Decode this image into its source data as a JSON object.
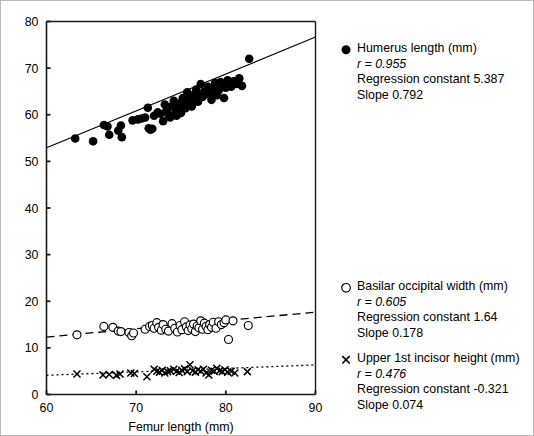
{
  "chart_data": {
    "type": "scatter",
    "title": "",
    "xlabel": "Femur length (mm)",
    "ylabel": "",
    "xlim": [
      60,
      90
    ],
    "ylim": [
      0,
      80
    ],
    "xticks": [
      60,
      70,
      80,
      90
    ],
    "yticks": [
      0,
      10,
      20,
      30,
      40,
      50,
      60,
      70,
      80
    ],
    "grid": false,
    "legend_position": "right",
    "series": [
      {
        "name": "Humerus length (mm)",
        "marker": "filled-circle",
        "line_style": "solid",
        "r": 0.955,
        "r_label": "r = 0.955",
        "regression_constant": 5.387,
        "regression_constant_label": "Regression constant 5.387",
        "slope": 0.792,
        "slope_label": "Slope 0.792",
        "points": [
          [
            63.2,
            54.9
          ],
          [
            65.2,
            54.3
          ],
          [
            66.4,
            57.8
          ],
          [
            66.8,
            57.5
          ],
          [
            67.0,
            55.7
          ],
          [
            68.0,
            56.6
          ],
          [
            68.3,
            57.7
          ],
          [
            68.4,
            55.2
          ],
          [
            69.6,
            58.8
          ],
          [
            70.2,
            59.0
          ],
          [
            70.6,
            59.2
          ],
          [
            71.0,
            59.4
          ],
          [
            71.3,
            61.5
          ],
          [
            71.4,
            57.1
          ],
          [
            71.6,
            56.8
          ],
          [
            71.8,
            57.0
          ],
          [
            72.0,
            59.8
          ],
          [
            72.4,
            60.5
          ],
          [
            72.7,
            60.2
          ],
          [
            73.0,
            58.6
          ],
          [
            73.2,
            62.2
          ],
          [
            73.4,
            61.0
          ],
          [
            73.6,
            60.0
          ],
          [
            73.8,
            59.4
          ],
          [
            74.0,
            61.8
          ],
          [
            74.2,
            63.0
          ],
          [
            74.4,
            60.6
          ],
          [
            74.5,
            59.8
          ],
          [
            74.7,
            62.4
          ],
          [
            74.9,
            61.2
          ],
          [
            75.0,
            60.4
          ],
          [
            75.2,
            63.6
          ],
          [
            75.3,
            62.0
          ],
          [
            75.5,
            61.4
          ],
          [
            75.7,
            64.8
          ],
          [
            75.9,
            63.2
          ],
          [
            76.0,
            62.6
          ],
          [
            76.2,
            61.8
          ],
          [
            76.4,
            64.2
          ],
          [
            76.5,
            63.4
          ],
          [
            76.7,
            65.4
          ],
          [
            76.9,
            62.8
          ],
          [
            77.0,
            64.0
          ],
          [
            77.2,
            66.6
          ],
          [
            77.4,
            63.8
          ],
          [
            77.6,
            65.0
          ],
          [
            77.8,
            64.4
          ],
          [
            78.0,
            66.0
          ],
          [
            78.2,
            64.8
          ],
          [
            78.4,
            63.2
          ],
          [
            78.6,
            65.6
          ],
          [
            78.8,
            66.8
          ],
          [
            79.0,
            64.2
          ],
          [
            79.2,
            65.2
          ],
          [
            79.4,
            67.0
          ],
          [
            79.6,
            66.2
          ],
          [
            79.8,
            63.6
          ],
          [
            80.0,
            65.8
          ],
          [
            80.2,
            67.4
          ],
          [
            80.4,
            66.4
          ],
          [
            80.6,
            66.0
          ],
          [
            80.9,
            67.2
          ],
          [
            81.2,
            66.6
          ],
          [
            81.5,
            67.8
          ],
          [
            81.8,
            66.2
          ],
          [
            82.6,
            72.0
          ]
        ]
      },
      {
        "name": "Basilar occipital width (mm)",
        "marker": "open-circle",
        "line_style": "dashed",
        "r": 0.605,
        "r_label": "r = 0.605",
        "regression_constant": 1.64,
        "regression_constant_label": "Regression constant 1.64",
        "slope": 0.178,
        "slope_label": "Slope 0.178",
        "points": [
          [
            63.4,
            12.8
          ],
          [
            66.4,
            14.6
          ],
          [
            67.4,
            14.4
          ],
          [
            68.0,
            13.6
          ],
          [
            68.3,
            13.5
          ],
          [
            69.2,
            13.3
          ],
          [
            69.5,
            12.6
          ],
          [
            69.7,
            13.2
          ],
          [
            71.0,
            14.0
          ],
          [
            71.5,
            14.6
          ],
          [
            71.8,
            14.8
          ],
          [
            72.0,
            14.2
          ],
          [
            72.3,
            15.4
          ],
          [
            72.5,
            14.4
          ],
          [
            72.8,
            13.8
          ],
          [
            73.0,
            15.0
          ],
          [
            73.3,
            14.0
          ],
          [
            73.6,
            13.6
          ],
          [
            74.0,
            15.2
          ],
          [
            74.3,
            14.2
          ],
          [
            74.6,
            13.4
          ],
          [
            74.9,
            14.8
          ],
          [
            75.1,
            13.9
          ],
          [
            75.4,
            15.6
          ],
          [
            75.6,
            14.5
          ],
          [
            75.8,
            13.7
          ],
          [
            76.0,
            14.9
          ],
          [
            76.2,
            14.1
          ],
          [
            76.4,
            15.1
          ],
          [
            76.6,
            13.5
          ],
          [
            76.8,
            14.7
          ],
          [
            77.0,
            14.3
          ],
          [
            77.2,
            15.8
          ],
          [
            77.4,
            14.0
          ],
          [
            77.6,
            15.3
          ],
          [
            77.8,
            14.6
          ],
          [
            78.0,
            13.9
          ],
          [
            78.2,
            15.0
          ],
          [
            78.4,
            14.4
          ],
          [
            78.6,
            15.5
          ],
          [
            78.9,
            14.2
          ],
          [
            79.2,
            15.6
          ],
          [
            79.5,
            15.0
          ],
          [
            79.8,
            15.4
          ],
          [
            80.0,
            16.0
          ],
          [
            80.3,
            11.8
          ],
          [
            80.8,
            15.8
          ],
          [
            82.5,
            14.8
          ]
        ]
      },
      {
        "name": "Upper 1st incisor height (mm)",
        "marker": "cross",
        "line_style": "dotted",
        "r": 0.476,
        "r_label": "r = 0.476",
        "regression_constant": -0.321,
        "regression_constant_label": "Regression constant -0.321",
        "slope": 0.074,
        "slope_label": "Slope 0.074",
        "points": [
          [
            63.4,
            4.4
          ],
          [
            66.3,
            4.2
          ],
          [
            67.0,
            4.3
          ],
          [
            67.8,
            4.1
          ],
          [
            68.2,
            4.4
          ],
          [
            69.4,
            4.6
          ],
          [
            69.8,
            4.5
          ],
          [
            71.2,
            3.8
          ],
          [
            72.0,
            5.4
          ],
          [
            72.3,
            5.0
          ],
          [
            72.6,
            4.8
          ],
          [
            72.9,
            5.2
          ],
          [
            73.2,
            4.6
          ],
          [
            73.5,
            4.9
          ],
          [
            73.8,
            5.1
          ],
          [
            74.2,
            5.4
          ],
          [
            74.5,
            5.0
          ],
          [
            74.8,
            4.7
          ],
          [
            75.1,
            5.2
          ],
          [
            75.4,
            5.5
          ],
          [
            75.7,
            4.9
          ],
          [
            76.0,
            6.4
          ],
          [
            76.3,
            5.1
          ],
          [
            76.6,
            4.8
          ],
          [
            76.9,
            5.3
          ],
          [
            77.2,
            5.0
          ],
          [
            77.5,
            5.4
          ],
          [
            77.8,
            4.6
          ],
          [
            78.1,
            4.2
          ],
          [
            78.4,
            5.2
          ],
          [
            78.7,
            5.0
          ],
          [
            79.0,
            5.6
          ],
          [
            79.3,
            5.1
          ],
          [
            79.6,
            4.9
          ],
          [
            79.9,
            5.3
          ],
          [
            80.2,
            4.8
          ],
          [
            80.6,
            5.0
          ],
          [
            81.0,
            4.6
          ],
          [
            82.4,
            4.9
          ]
        ]
      }
    ]
  }
}
